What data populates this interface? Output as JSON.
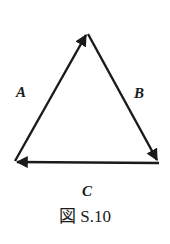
{
  "diagram": {
    "labels": {
      "a": "A",
      "b": "B",
      "c": "C"
    },
    "caption": "図 S.10",
    "vectors": [
      {
        "name": "A",
        "from": "bottom-left",
        "to": "top"
      },
      {
        "name": "B",
        "from": "top",
        "to": "bottom-right"
      },
      {
        "name": "C",
        "from": "bottom-right",
        "to": "bottom-left"
      }
    ],
    "stroke_color": "#1a1a1a"
  }
}
